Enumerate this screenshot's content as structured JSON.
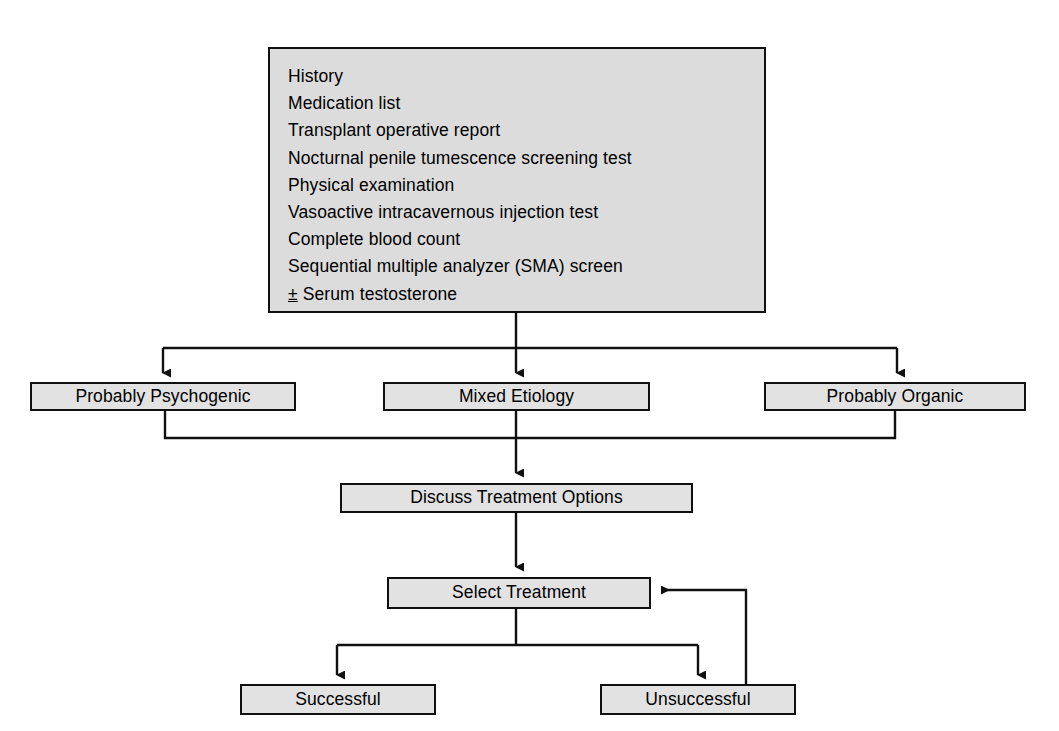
{
  "diagram": {
    "style": {
      "node_fill": "#e2e2e2",
      "node_fill_top": "#dcdcdc",
      "node_border": "#101010",
      "line_color": "#101010",
      "background": "#ffffff",
      "text_color": "#000000"
    },
    "nodes": [
      {
        "id": "evaluation",
        "type": "checklist-box",
        "items": [
          "History",
          "Medication list",
          "Transplant operative report",
          "Nocturnal penile tumescence screening test",
          "Physical examination",
          "Vasoactive intracavernous injection test",
          "Complete blood count",
          "Sequential multiple analyzer (SMA) screen"
        ],
        "optional_item": {
          "sign": "±",
          "text": " Serum testosterone"
        }
      },
      {
        "id": "psychogenic",
        "type": "box",
        "label": "Probably Psychogenic"
      },
      {
        "id": "mixed",
        "type": "box",
        "label": "Mixed Etiology"
      },
      {
        "id": "organic",
        "type": "box",
        "label": "Probably Organic"
      },
      {
        "id": "discuss",
        "type": "box",
        "label": "Discuss Treatment Options"
      },
      {
        "id": "select",
        "type": "box",
        "label": "Select Treatment"
      },
      {
        "id": "successful",
        "type": "box",
        "label": "Successful"
      },
      {
        "id": "unsuccessful",
        "type": "box",
        "label": "Unsuccessful"
      }
    ],
    "edges": [
      {
        "from": "evaluation",
        "to": "psychogenic",
        "arrow": true
      },
      {
        "from": "evaluation",
        "to": "mixed",
        "arrow": true
      },
      {
        "from": "evaluation",
        "to": "organic",
        "arrow": true
      },
      {
        "from": "psychogenic",
        "to": "discuss",
        "arrow": false
      },
      {
        "from": "mixed",
        "to": "discuss",
        "arrow": true
      },
      {
        "from": "organic",
        "to": "discuss",
        "arrow": false
      },
      {
        "from": "discuss",
        "to": "select",
        "arrow": true
      },
      {
        "from": "select",
        "to": "successful",
        "arrow": true
      },
      {
        "from": "select",
        "to": "unsuccessful",
        "arrow": true
      },
      {
        "from": "unsuccessful",
        "to": "select",
        "arrow": true,
        "note": "retry loop"
      }
    ]
  }
}
